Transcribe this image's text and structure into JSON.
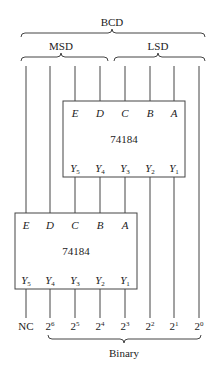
{
  "labels": {
    "bcd": "BCD",
    "msd": "MSD",
    "lsd": "LSD",
    "binary": "Binary"
  },
  "top_chip": {
    "name": "74184",
    "inputs": [
      "E",
      "D",
      "C",
      "B",
      "A"
    ],
    "outputs": [
      {
        "base": "Y",
        "sub": "5"
      },
      {
        "base": "Y",
        "sub": "4"
      },
      {
        "base": "Y",
        "sub": "3"
      },
      {
        "base": "Y",
        "sub": "2"
      },
      {
        "base": "Y",
        "sub": "1"
      }
    ]
  },
  "bottom_chip": {
    "name": "74184",
    "inputs": [
      "E",
      "D",
      "C",
      "B",
      "A"
    ],
    "outputs": [
      {
        "base": "Y",
        "sub": "5"
      },
      {
        "base": "Y",
        "sub": "4"
      },
      {
        "base": "Y",
        "sub": "3"
      },
      {
        "base": "Y",
        "sub": "2"
      },
      {
        "base": "Y",
        "sub": "1"
      }
    ]
  },
  "bottom_outputs": [
    {
      "base": "NC",
      "sup": ""
    },
    {
      "base": "2",
      "sup": "6"
    },
    {
      "base": "2",
      "sup": "5"
    },
    {
      "base": "2",
      "sup": "4"
    },
    {
      "base": "2",
      "sup": "3"
    },
    {
      "base": "2",
      "sup": "2"
    },
    {
      "base": "2",
      "sup": "1"
    },
    {
      "base": "2",
      "sup": "0"
    }
  ],
  "colors": {
    "line": "#444444",
    "text": "#222222",
    "background": "#ffffff"
  }
}
